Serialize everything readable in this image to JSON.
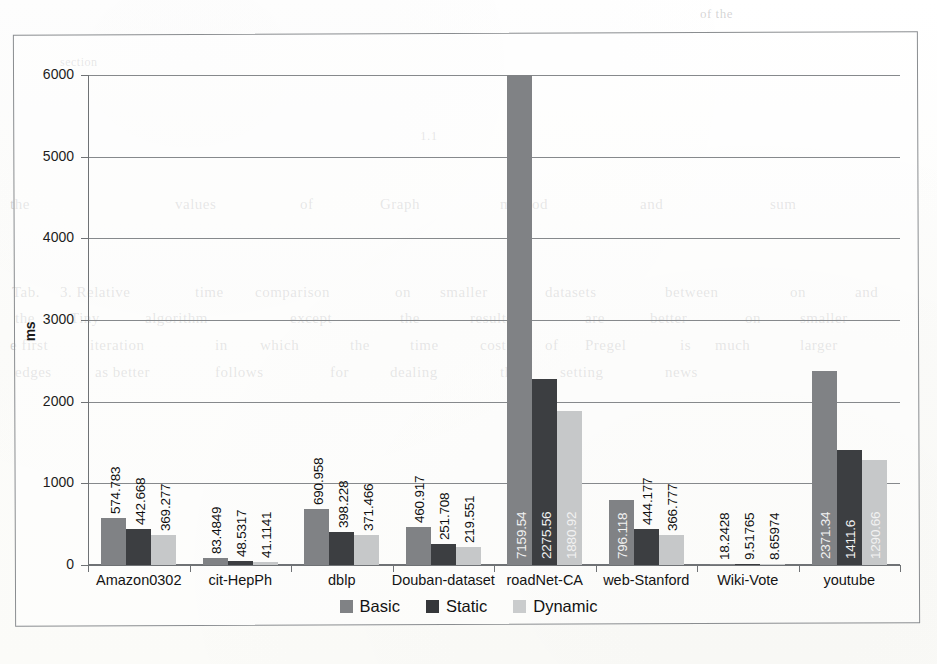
{
  "figure": {
    "type": "scanned-bar-chart",
    "y_axis_title": "ms"
  },
  "chart_data": {
    "type": "bar",
    "title": "",
    "subtitle": "",
    "xlabel": "",
    "ylabel": "ms",
    "ylim": [
      0,
      6000
    ],
    "yticks": [
      0,
      1000,
      2000,
      3000,
      4000,
      5000,
      6000
    ],
    "ytick_labels": [
      "0",
      "1000",
      "2000",
      "3000",
      "4000",
      "5000",
      "6000"
    ],
    "grid": true,
    "legend_position": "bottom",
    "categories": [
      "Amazon0302",
      "cit-HepPh",
      "dblp",
      "Douban-dataset",
      "roadNet-CA",
      "web-Stanford",
      "Wiki-Vote",
      "youtube"
    ],
    "series": [
      {
        "name": "Basic",
        "color": "#808285",
        "values": [
          574.783,
          83.4849,
          690.958,
          460.917,
          7159.54,
          796.118,
          18.2428,
          2371.34
        ],
        "labels": [
          "574.783",
          "83.4849",
          "690.958",
          "460.917",
          "7159.54",
          "796.118",
          "18.2428",
          "2371.34"
        ]
      },
      {
        "name": "Static",
        "color": "#3c3e41",
        "values": [
          442.668,
          48.5317,
          398.228,
          251.708,
          2275.56,
          444.177,
          9.51765,
          1411.6
        ],
        "labels": [
          "442.668",
          "48.5317",
          "398.228",
          "251.708",
          "2275.56",
          "444.177",
          "9.51765",
          "1411.6"
        ]
      },
      {
        "name": "Dynamic",
        "color": "#c6c8c9",
        "values": [
          369.277,
          41.1141,
          371.466,
          219.551,
          1880.92,
          366.777,
          8.65974,
          1290.66
        ],
        "labels": [
          "369.277",
          "41.1141",
          "371.466",
          "219.551",
          "1880.92",
          "366.777",
          "8.65974",
          "1290.66"
        ]
      }
    ],
    "annotations": [
      "Basic bar for roadNet-CA (7159.54) exceeds the 6000 axis maximum and is clipped at the plot top."
    ]
  },
  "legend": {
    "items": [
      {
        "label": "Basic",
        "color": "#808285"
      },
      {
        "label": "Static",
        "color": "#35373a"
      },
      {
        "label": "Dynamic",
        "color": "#cacccd"
      }
    ]
  },
  "page_bleed_text": [
    {
      "text": "of the",
      "x": 700,
      "y": 6,
      "size": 13
    },
    {
      "text": "section",
      "x": 60,
      "y": 55,
      "size": 12
    },
    {
      "text": "1.1",
      "x": 420,
      "y": 128,
      "size": 13
    },
    {
      "text": "the",
      "x": 10,
      "y": 196,
      "size": 15
    },
    {
      "text": "values",
      "x": 175,
      "y": 196,
      "size": 15
    },
    {
      "text": "of",
      "x": 300,
      "y": 196,
      "size": 15
    },
    {
      "text": "Graph",
      "x": 380,
      "y": 196,
      "size": 15
    },
    {
      "text": "method",
      "x": 500,
      "y": 196,
      "size": 15
    },
    {
      "text": "and",
      "x": 640,
      "y": 196,
      "size": 15
    },
    {
      "text": "sum",
      "x": 770,
      "y": 196,
      "size": 15
    },
    {
      "text": "Tab.",
      "x": 12,
      "y": 284,
      "size": 15
    },
    {
      "text": "3. Relative",
      "x": 60,
      "y": 284,
      "size": 15
    },
    {
      "text": "time",
      "x": 195,
      "y": 284,
      "size": 15
    },
    {
      "text": "comparison",
      "x": 255,
      "y": 284,
      "size": 15
    },
    {
      "text": "on",
      "x": 395,
      "y": 284,
      "size": 15
    },
    {
      "text": "smaller",
      "x": 440,
      "y": 284,
      "size": 15
    },
    {
      "text": "datasets",
      "x": 545,
      "y": 284,
      "size": 15
    },
    {
      "text": "between",
      "x": 665,
      "y": 284,
      "size": 15
    },
    {
      "text": "on",
      "x": 790,
      "y": 284,
      "size": 15
    },
    {
      "text": "and",
      "x": 855,
      "y": 284,
      "size": 15
    },
    {
      "text": "the",
      "x": 15,
      "y": 310,
      "size": 15
    },
    {
      "text": "Tiny",
      "x": 70,
      "y": 310,
      "size": 15
    },
    {
      "text": "algorithm",
      "x": 145,
      "y": 310,
      "size": 15
    },
    {
      "text": "except",
      "x": 290,
      "y": 310,
      "size": 15
    },
    {
      "text": "the",
      "x": 400,
      "y": 310,
      "size": 15
    },
    {
      "text": "results",
      "x": 470,
      "y": 310,
      "size": 15
    },
    {
      "text": "are",
      "x": 585,
      "y": 310,
      "size": 15
    },
    {
      "text": "better",
      "x": 650,
      "y": 310,
      "size": 15
    },
    {
      "text": "on",
      "x": 745,
      "y": 310,
      "size": 15
    },
    {
      "text": "smaller",
      "x": 800,
      "y": 310,
      "size": 15
    },
    {
      "text": "e first",
      "x": 10,
      "y": 337,
      "size": 15
    },
    {
      "text": "iteration",
      "x": 90,
      "y": 337,
      "size": 15
    },
    {
      "text": "in",
      "x": 215,
      "y": 337,
      "size": 15
    },
    {
      "text": "which",
      "x": 260,
      "y": 337,
      "size": 15
    },
    {
      "text": "the",
      "x": 350,
      "y": 337,
      "size": 15
    },
    {
      "text": "time",
      "x": 410,
      "y": 337,
      "size": 15
    },
    {
      "text": "cost",
      "x": 480,
      "y": 337,
      "size": 15
    },
    {
      "text": "of",
      "x": 545,
      "y": 337,
      "size": 15
    },
    {
      "text": "Pregel",
      "x": 585,
      "y": 337,
      "size": 15
    },
    {
      "text": "is",
      "x": 680,
      "y": 337,
      "size": 15
    },
    {
      "text": "much",
      "x": 715,
      "y": 337,
      "size": 15
    },
    {
      "text": "larger",
      "x": 800,
      "y": 337,
      "size": 15
    },
    {
      "text": "edges",
      "x": 15,
      "y": 364,
      "size": 15
    },
    {
      "text": "as better",
      "x": 95,
      "y": 364,
      "size": 15
    },
    {
      "text": "follows",
      "x": 215,
      "y": 364,
      "size": 15
    },
    {
      "text": "for",
      "x": 330,
      "y": 364,
      "size": 15
    },
    {
      "text": "dealing",
      "x": 390,
      "y": 364,
      "size": 15
    },
    {
      "text": "the",
      "x": 500,
      "y": 364,
      "size": 15
    },
    {
      "text": "setting",
      "x": 560,
      "y": 364,
      "size": 15
    },
    {
      "text": "news",
      "x": 665,
      "y": 364,
      "size": 15
    }
  ]
}
